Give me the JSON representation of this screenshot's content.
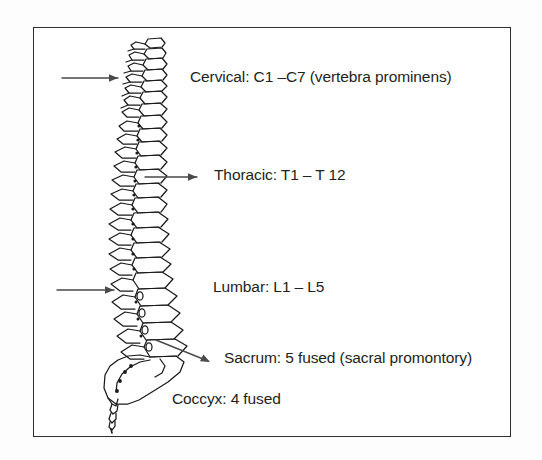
{
  "figure": {
    "frame_color": "#2f2f2f",
    "background_color": "#ffffff",
    "ink_color": "#231f20"
  },
  "labels": [
    {
      "id": "cervical",
      "text": "Cervical: C1 –C7 (vertebra prominens)"
    },
    {
      "id": "thoracic",
      "text": "Thoracic: T1 – T 12"
    },
    {
      "id": "lumbar",
      "text": "Lumbar: L1 – L5"
    },
    {
      "id": "sacrum",
      "text": "Sacrum: 5 fused (sacral promontory)"
    },
    {
      "id": "coccyx",
      "text": "Coccyx: 4 fused"
    }
  ],
  "arrows": [
    {
      "id": "cervical-arrow",
      "points_to": "cervical-vertebrae"
    },
    {
      "id": "thoracic-arrow",
      "points_to": "thoracic-vertebrae"
    },
    {
      "id": "lumbar-arrow",
      "points_to": "lumbar-vertebrae"
    },
    {
      "id": "sacrum-arrow",
      "points_to": "sacrum"
    }
  ],
  "illustration": {
    "name": "spine-illustration",
    "regions": [
      "cervical",
      "thoracic",
      "lumbar",
      "sacrum",
      "coccyx"
    ]
  }
}
